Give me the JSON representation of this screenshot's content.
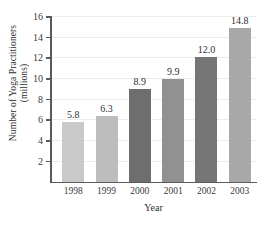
{
  "chart_data": {
    "type": "bar",
    "title": "",
    "xlabel": "Year",
    "ylabel_line1": "Number of Yoga Practitioners",
    "ylabel_line2": "(millions)",
    "categories": [
      "1998",
      "1999",
      "2000",
      "2001",
      "2002",
      "2003"
    ],
    "values": [
      5.8,
      6.3,
      8.9,
      9.9,
      12.0,
      14.8
    ],
    "value_labels": [
      "5.8",
      "6.3",
      "8.9",
      "9.9",
      "12.0",
      "14.8"
    ],
    "bar_colors": [
      "#c9c9c9",
      "#bdbdbd",
      "#6e6e6e",
      "#919191",
      "#767676",
      "#a8a8a8"
    ],
    "ylim": [
      0,
      16
    ],
    "yticks": [
      2,
      4,
      6,
      8,
      10,
      12,
      14,
      16
    ],
    "ytick_labels": [
      "2",
      "4",
      "6",
      "8",
      "10",
      "12",
      "14",
      "16"
    ],
    "grid": true,
    "grid_color": "#ececec",
    "axis_color": "#5a5a5a",
    "legend": "none",
    "text_color": "#2f2f2f"
  }
}
